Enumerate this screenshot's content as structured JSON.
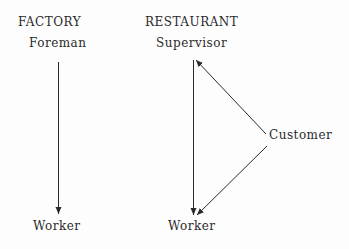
{
  "factory": {
    "heading": "FACTORY",
    "top": "Foreman",
    "bottom": "Worker"
  },
  "restaurant": {
    "heading": "RESTAURANT",
    "top": "Supervisor",
    "side": "Customer",
    "bottom": "Worker"
  },
  "edges": [
    {
      "from": "Foreman",
      "to": "Worker",
      "group": "factory"
    },
    {
      "from": "Supervisor",
      "to": "Worker",
      "group": "restaurant"
    },
    {
      "from": "Customer",
      "to": "Supervisor",
      "group": "restaurant"
    },
    {
      "from": "Customer",
      "to": "Worker",
      "group": "restaurant"
    }
  ]
}
